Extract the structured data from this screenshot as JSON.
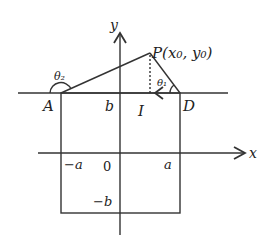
{
  "diagram": {
    "labels": {
      "y_axis": "y",
      "x_axis": "x",
      "point_P": "P(x₀, y₀)",
      "point_A": "A",
      "point_D": "D",
      "b_top": "b",
      "current": "I",
      "theta1": "θ₁",
      "theta2": "θ₂",
      "neg_a": "−a",
      "origin": "0",
      "pos_a": "a",
      "neg_b": "−b"
    },
    "colors": {
      "line": "#333333",
      "background": "#ffffff"
    }
  }
}
